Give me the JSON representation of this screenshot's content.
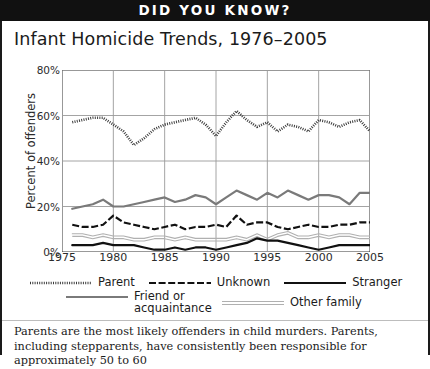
{
  "banner": {
    "text": "DID YOU KNOW?"
  },
  "title": "Infant Homicide Trends, 1976–2005",
  "caption": "Parents are the most likely offenders in child murders. Parents, including stepparents, have consistently been responsible for approximately 50 to 60",
  "legend": {
    "row1": [
      {
        "label": "Parent",
        "style": "dotted",
        "color": "#3a3a3a"
      },
      {
        "label": "Unknown",
        "style": "dashed",
        "color": "#111111"
      },
      {
        "label": "Stranger",
        "style": "solid-thick",
        "color": "#111111"
      }
    ],
    "row2": [
      {
        "label": "Friend or acquaintance",
        "style": "solid-gray",
        "color": "#7a7a7a"
      },
      {
        "label": "Other family",
        "style": "solid-light",
        "color": "#b0b0b0"
      }
    ]
  },
  "chart_data": {
    "type": "line",
    "title": "Infant Homicide Trends, 1976–2005",
    "xlabel": "",
    "ylabel": "Percent of offenders",
    "xlim": [
      1975,
      2005
    ],
    "ylim": [
      0,
      80
    ],
    "yticks": [
      0,
      20,
      40,
      60,
      80
    ],
    "ytick_labels": [
      "0%",
      "20%",
      "40%",
      "60%",
      "80%"
    ],
    "xticks": [
      1975,
      1980,
      1985,
      1990,
      1995,
      2000,
      2005
    ],
    "xtick_labels": [
      "1975",
      "1980",
      "1985",
      "1990",
      "1995",
      "2000",
      "2005"
    ],
    "grid": true,
    "legend_position": "below",
    "x": [
      1976,
      1977,
      1978,
      1979,
      1980,
      1981,
      1982,
      1983,
      1984,
      1985,
      1986,
      1987,
      1988,
      1989,
      1990,
      1991,
      1992,
      1993,
      1994,
      1995,
      1996,
      1997,
      1998,
      1999,
      2000,
      2001,
      2002,
      2003,
      2004,
      2005
    ],
    "series": [
      {
        "name": "Parent",
        "style": "dotted",
        "color": "#3a3a3a",
        "values": [
          57,
          58,
          59,
          59,
          56,
          53,
          47,
          50,
          54,
          56,
          57,
          58,
          59,
          56,
          51,
          57,
          62,
          58,
          55,
          57,
          53,
          56,
          55,
          53,
          58,
          57,
          55,
          57,
          58,
          53
        ]
      },
      {
        "name": "Friend or acquaintance",
        "style": "solid-gray",
        "color": "#7a7a7a",
        "values": [
          19,
          20,
          21,
          23,
          20,
          20,
          21,
          22,
          23,
          24,
          22,
          23,
          25,
          24,
          21,
          24,
          27,
          25,
          23,
          26,
          24,
          27,
          25,
          23,
          25,
          25,
          24,
          21,
          26,
          26
        ]
      },
      {
        "name": "Unknown",
        "style": "dashed",
        "color": "#111111",
        "values": [
          12,
          11,
          11,
          12,
          16,
          13,
          12,
          11,
          10,
          11,
          12,
          10,
          11,
          11,
          12,
          11,
          16,
          12,
          13,
          13,
          11,
          10,
          11,
          12,
          11,
          11,
          12,
          12,
          13,
          13
        ]
      },
      {
        "name": "Other family",
        "style": "solid-light",
        "color": "#b0b0b0",
        "values": [
          8,
          8,
          7,
          8,
          7,
          7,
          6,
          6,
          7,
          7,
          6,
          7,
          6,
          6,
          6,
          6,
          7,
          6,
          8,
          6,
          8,
          9,
          7,
          7,
          8,
          7,
          8,
          8,
          7,
          7
        ]
      },
      {
        "name": "Stranger",
        "style": "solid-thick",
        "color": "#111111",
        "values": [
          3,
          3,
          3,
          4,
          3,
          3,
          3,
          2,
          1,
          1,
          2,
          1,
          2,
          2,
          1,
          2,
          3,
          4,
          6,
          5,
          5,
          4,
          3,
          2,
          1,
          2,
          3,
          3,
          3,
          3
        ]
      }
    ]
  }
}
